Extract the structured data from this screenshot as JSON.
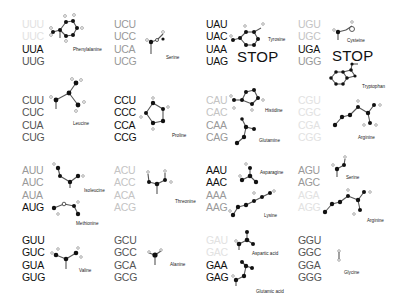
{
  "colors": {
    "black": "#111111",
    "dark": "#555555",
    "mid": "#999999",
    "light": "#c4c4c4",
    "faint": "#e2e2e2"
  },
  "blocks": [
    {
      "id": "UU",
      "x": 22,
      "y": 18,
      "codons": [
        {
          "text": "UUU",
          "shade": "faint"
        },
        {
          "text": "UUC",
          "shade": "faint"
        },
        {
          "text": "UUA",
          "shade": "black"
        },
        {
          "text": "UUG",
          "shade": "dark"
        }
      ]
    },
    {
      "id": "UC",
      "x": 114,
      "y": 18,
      "codons": [
        {
          "text": "UCU",
          "shade": "mid"
        },
        {
          "text": "UCC",
          "shade": "mid"
        },
        {
          "text": "UCA",
          "shade": "mid"
        },
        {
          "text": "UCG",
          "shade": "mid"
        }
      ]
    },
    {
      "id": "UA",
      "x": 206,
      "y": 18,
      "codons": [
        {
          "text": "UAU",
          "shade": "black"
        },
        {
          "text": "UAC",
          "shade": "black"
        },
        {
          "text": "UAA",
          "shade": "black"
        },
        {
          "text": "UAG",
          "shade": "black"
        }
      ]
    },
    {
      "id": "UG",
      "x": 298,
      "y": 18,
      "codons": [
        {
          "text": "UGU",
          "shade": "light"
        },
        {
          "text": "UGC",
          "shade": "light"
        },
        {
          "text": "UGA",
          "shade": "black"
        },
        {
          "text": "UGG",
          "shade": "mid"
        }
      ]
    },
    {
      "id": "CU",
      "x": 22,
      "y": 94,
      "codons": [
        {
          "text": "CUU",
          "shade": "dark"
        },
        {
          "text": "CUC",
          "shade": "dark"
        },
        {
          "text": "CUA",
          "shade": "dark"
        },
        {
          "text": "CUG",
          "shade": "dark"
        }
      ]
    },
    {
      "id": "CC",
      "x": 114,
      "y": 94,
      "codons": [
        {
          "text": "CCU",
          "shade": "black"
        },
        {
          "text": "CCC",
          "shade": "black"
        },
        {
          "text": "CCA",
          "shade": "black"
        },
        {
          "text": "CCG",
          "shade": "black"
        }
      ]
    },
    {
      "id": "CA",
      "x": 206,
      "y": 94,
      "codons": [
        {
          "text": "CAU",
          "shade": "light"
        },
        {
          "text": "CAC",
          "shade": "light"
        },
        {
          "text": "CAA",
          "shade": "mid"
        },
        {
          "text": "CAG",
          "shade": "mid"
        }
      ]
    },
    {
      "id": "CG",
      "x": 298,
      "y": 94,
      "codons": [
        {
          "text": "CGU",
          "shade": "faint"
        },
        {
          "text": "CGC",
          "shade": "faint"
        },
        {
          "text": "CGA",
          "shade": "faint"
        },
        {
          "text": "CGG",
          "shade": "faint"
        }
      ]
    },
    {
      "id": "AU",
      "x": 22,
      "y": 164,
      "codons": [
        {
          "text": "AUU",
          "shade": "mid"
        },
        {
          "text": "AUC",
          "shade": "mid"
        },
        {
          "text": "AUA",
          "shade": "mid"
        },
        {
          "text": "AUG",
          "shade": "black"
        }
      ]
    },
    {
      "id": "AC",
      "x": 114,
      "y": 164,
      "codons": [
        {
          "text": "ACU",
          "shade": "light"
        },
        {
          "text": "ACC",
          "shade": "light"
        },
        {
          "text": "ACA",
          "shade": "light"
        },
        {
          "text": "ACG",
          "shade": "light"
        }
      ]
    },
    {
      "id": "AA",
      "x": 206,
      "y": 164,
      "codons": [
        {
          "text": "AAU",
          "shade": "black"
        },
        {
          "text": "AAC",
          "shade": "black"
        },
        {
          "text": "AAA",
          "shade": "mid"
        },
        {
          "text": "AAG",
          "shade": "mid"
        }
      ]
    },
    {
      "id": "AG",
      "x": 298,
      "y": 164,
      "codons": [
        {
          "text": "AGU",
          "shade": "mid"
        },
        {
          "text": "AGC",
          "shade": "mid"
        },
        {
          "text": "AGA",
          "shade": "faint"
        },
        {
          "text": "AGG",
          "shade": "faint"
        }
      ]
    },
    {
      "id": "GU",
      "x": 22,
      "y": 234,
      "codons": [
        {
          "text": "GUU",
          "shade": "black"
        },
        {
          "text": "GUC",
          "shade": "black"
        },
        {
          "text": "GUA",
          "shade": "black"
        },
        {
          "text": "GUG",
          "shade": "black"
        }
      ]
    },
    {
      "id": "GC",
      "x": 114,
      "y": 234,
      "codons": [
        {
          "text": "GCU",
          "shade": "dark"
        },
        {
          "text": "GCC",
          "shade": "dark"
        },
        {
          "text": "GCA",
          "shade": "dark"
        },
        {
          "text": "GCG",
          "shade": "dark"
        }
      ]
    },
    {
      "id": "GA",
      "x": 206,
      "y": 234,
      "codons": [
        {
          "text": "GAU",
          "shade": "faint"
        },
        {
          "text": "GAC",
          "shade": "faint"
        },
        {
          "text": "GAA",
          "shade": "black"
        },
        {
          "text": "GAG",
          "shade": "black"
        }
      ]
    },
    {
      "id": "GG",
      "x": 298,
      "y": 234,
      "codons": [
        {
          "text": "GGU",
          "shade": "dark"
        },
        {
          "text": "GGC",
          "shade": "dark"
        },
        {
          "text": "GGA",
          "shade": "dark"
        },
        {
          "text": "GGG",
          "shade": "dark"
        }
      ]
    }
  ],
  "amino_acids": [
    {
      "name": "Phenylalanine",
      "x": 73,
      "y": 47
    },
    {
      "name": "Serine",
      "x": 166,
      "y": 55
    },
    {
      "name": "Tyrosine",
      "x": 268,
      "y": 37
    },
    {
      "name": "Cysteine",
      "x": 347,
      "y": 38
    },
    {
      "name": "Tryptophan",
      "x": 362,
      "y": 84
    },
    {
      "name": "Leucine",
      "x": 73,
      "y": 121
    },
    {
      "name": "Proline",
      "x": 172,
      "y": 133
    },
    {
      "name": "Histidine",
      "x": 265,
      "y": 108
    },
    {
      "name": "Glutamine",
      "x": 259,
      "y": 138
    },
    {
      "name": "Arginine",
      "x": 358,
      "y": 135
    },
    {
      "name": "Isoleucine",
      "x": 84,
      "y": 188
    },
    {
      "name": "Methionine",
      "x": 76,
      "y": 221
    },
    {
      "name": "Threonine",
      "x": 175,
      "y": 199
    },
    {
      "name": "Asparagine",
      "x": 260,
      "y": 170
    },
    {
      "name": "Serine",
      "x": 346,
      "y": 175
    },
    {
      "name": "Lysine",
      "x": 264,
      "y": 213
    },
    {
      "name": "Arginine",
      "x": 367,
      "y": 218
    },
    {
      "name": "Valine",
      "x": 79,
      "y": 268
    },
    {
      "name": "Alanine",
      "x": 170,
      "y": 262
    },
    {
      "name": "Aspartic acid",
      "x": 252,
      "y": 251
    },
    {
      "name": "Glutamic acid",
      "x": 256,
      "y": 289
    },
    {
      "name": "Glycine",
      "x": 344,
      "y": 270
    }
  ],
  "stops": [
    {
      "text": "STOP",
      "x": 237,
      "y": 48
    },
    {
      "text": "STOP",
      "x": 332,
      "y": 47
    }
  ]
}
